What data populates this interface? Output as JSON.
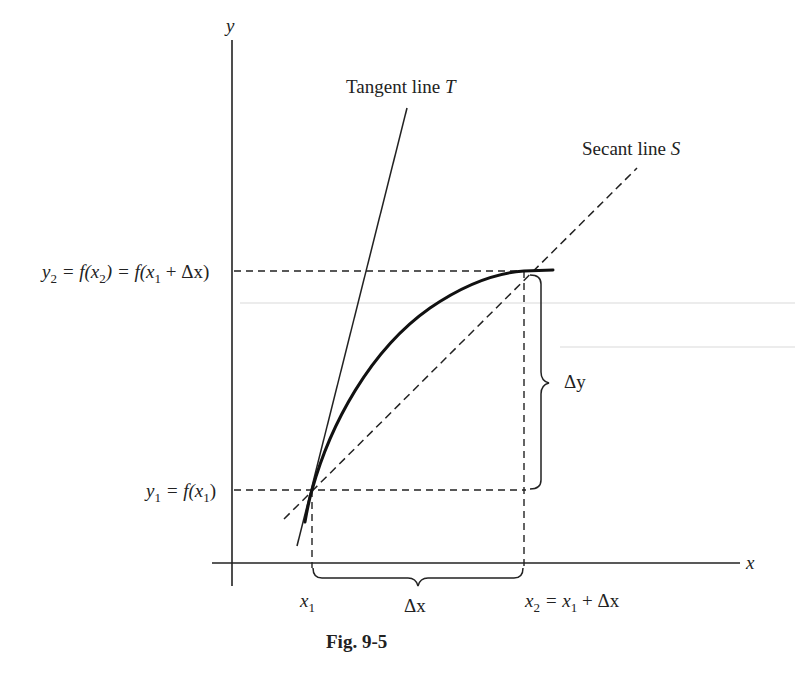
{
  "figure": {
    "caption": "Fig. 9-5",
    "axes": {
      "x_label": "x",
      "y_label": "y"
    },
    "lines": {
      "tangent_label": "Tangent line ",
      "tangent_symbol": "T",
      "secant_label": "Secant line ",
      "secant_symbol": "S"
    },
    "labels": {
      "y2_lhs": "y",
      "y2_sub": "2",
      "y2_eq1": " = f(x",
      "y2_sub2": "2",
      "y2_eq2": ") = f(x",
      "y2_sub3": "1",
      "y2_eq3": " + Δx)",
      "y1_lhs": "y",
      "y1_sub": "1",
      "y1_eq": " = f(x",
      "y1_sub2": "1",
      "y1_close": ")",
      "x1": "x",
      "x1_sub": "1",
      "x2": "x",
      "x2_sub": "2",
      "x2_eq": " = x",
      "x2_sub2": "1",
      "x2_rest": " + Δx",
      "delta_x": "Δx",
      "delta_y": "Δy"
    },
    "colors": {
      "ink": "#222222",
      "background": "#ffffff"
    }
  }
}
